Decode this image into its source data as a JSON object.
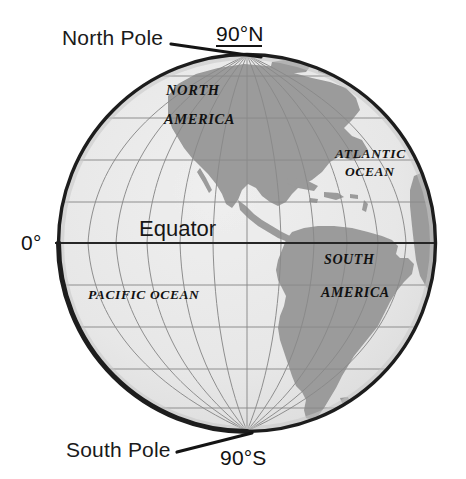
{
  "figure": {
    "type": "globe-diagram",
    "background_color": "#ffffff"
  },
  "colors": {
    "ocean": "#e6e6e6",
    "land": "#9b9b9b",
    "outline": "#1d1d1d",
    "graticule": "#8a8a8a",
    "equator_line": "#262626",
    "text": "#141414"
  },
  "callouts": {
    "north_pole": {
      "label": "North Pole",
      "coordinate": "90°N"
    },
    "south_pole": {
      "label": "South Pole",
      "coordinate": "90°S"
    },
    "equator": {
      "label": "Equator",
      "coordinate": "0°"
    }
  },
  "map_labels": {
    "north_america": {
      "line1": "NORTH",
      "line2": "AMERICA"
    },
    "south_america": {
      "line1": "SOUTH",
      "line2": "AMERICA"
    },
    "atlantic_ocean": {
      "line1": "ATLANTIC",
      "line2": "OCEAN"
    },
    "pacific_ocean": {
      "line1": "PACIFIC OCEAN"
    }
  },
  "geometry": {
    "globe_center_x": 247,
    "globe_center_y": 243,
    "globe_radius": 189,
    "parallel_latitudes": [
      80,
      60,
      40,
      20,
      0,
      -20,
      -40,
      -60,
      -80
    ],
    "meridian_count": 11
  }
}
